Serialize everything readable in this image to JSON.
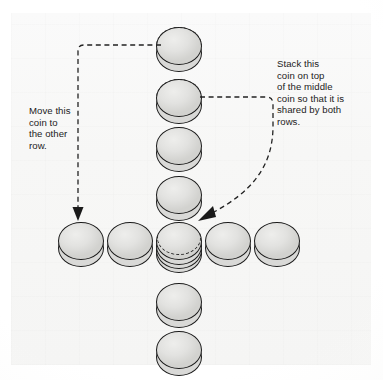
{
  "figure": {
    "background_color": "#f7f7f6",
    "ink_color": "#1c1c1c",
    "coin_fill": "#e2e2e0"
  },
  "annotations": {
    "left_note": "Move this\ncoin to\nthe other\nrow.",
    "right_note": "Stack this\ncoin on top\nof the middle\ncoin so that it is\nshared by both\nrows."
  },
  "coins": {
    "vertical_column_label": "vertical row of coins",
    "horizontal_row_label": "horizontal row of coins",
    "vertical": [
      {
        "name": "coin-v1",
        "x": 156,
        "y": 27,
        "ghost_top": true,
        "stack": 1
      },
      {
        "name": "coin-v2",
        "x": 156,
        "y": 79,
        "ghost_top": true,
        "stack": 1
      },
      {
        "name": "coin-v3",
        "x": 156,
        "y": 127,
        "ghost_top": false,
        "stack": 1
      },
      {
        "name": "coin-v4",
        "x": 156,
        "y": 176,
        "ghost_top": false,
        "stack": 1
      },
      {
        "name": "coin-v5-center",
        "x": 156,
        "y": 222,
        "ghost_top": false,
        "stack": 3,
        "ghost_band": true
      },
      {
        "name": "coin-v6",
        "x": 156,
        "y": 283,
        "ghost_top": false,
        "stack": 1
      },
      {
        "name": "coin-v7",
        "x": 156,
        "y": 331,
        "ghost_top": false,
        "stack": 1
      }
    ],
    "horizontal": [
      {
        "name": "coin-h1",
        "x": 58,
        "y": 222,
        "ghost_top": false,
        "stack": 1
      },
      {
        "name": "coin-h2",
        "x": 107,
        "y": 222,
        "ghost_top": false,
        "stack": 1
      },
      {
        "name": "coin-h4",
        "x": 205,
        "y": 222,
        "ghost_top": false,
        "stack": 1
      },
      {
        "name": "coin-h5",
        "x": 254,
        "y": 222,
        "ghost_top": false,
        "stack": 1
      }
    ]
  },
  "arrows": {
    "left_arrow_label": "move-coin-arrow",
    "right_arrow_label": "stack-coin-arrow",
    "style": "dashed",
    "color": "#222222"
  }
}
